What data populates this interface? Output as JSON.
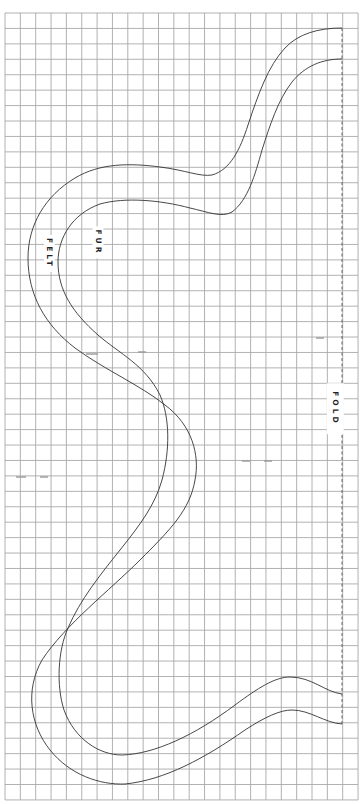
{
  "diagram": {
    "type": "sewing-pattern",
    "grid": {
      "x0": 5,
      "y0": 13,
      "cols": 23,
      "rows": 51,
      "cell_w": 15.35,
      "cell_h": 15.43,
      "line_color": "#a9a9a9"
    },
    "fold_line": {
      "x": 342,
      "y_start": 28,
      "y_end": 724,
      "style": "dashed"
    },
    "labels": {
      "felt": "FELT",
      "fur": "FUR",
      "fold": "FOLD"
    },
    "outline_color": "#333333"
  }
}
